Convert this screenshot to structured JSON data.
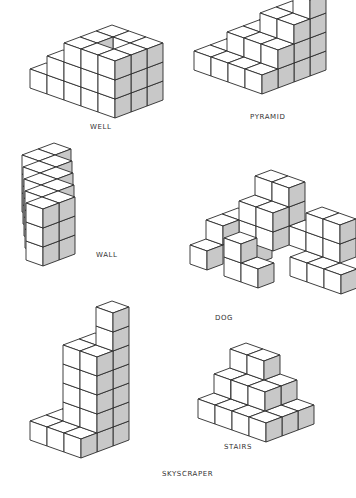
{
  "figure": {
    "structures": [
      {
        "id": "well",
        "label": "WELL"
      },
      {
        "id": "pyramid",
        "label": "PYRAMID"
      },
      {
        "id": "wall",
        "label": "WALL"
      },
      {
        "id": "dog",
        "label": "DOG"
      },
      {
        "id": "skyscraper",
        "label": "SKYSCRAPER"
      },
      {
        "id": "stairs",
        "label": "STAIRS"
      }
    ],
    "colors": {
      "line": "#2a2a2a",
      "lit_face": "#ffffff",
      "shaded_face": "#c8c8c8",
      "label": "#333333"
    }
  }
}
